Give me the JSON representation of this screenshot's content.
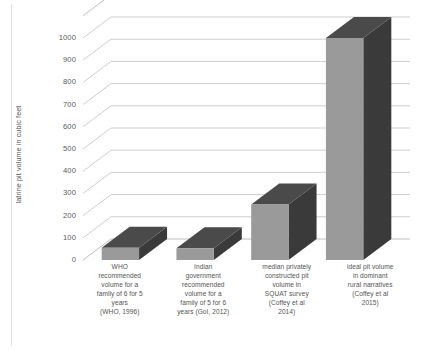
{
  "chart": {
    "ylabel": "latrine pit volume in cubic feet",
    "grid": true,
    "legend": "none"
  },
  "chart_data": {
    "type": "bar",
    "title": "",
    "subtitle": "",
    "xlabel": "",
    "ylabel": "latrine pit volume in cubic feet",
    "ylim": [
      0,
      1000
    ],
    "ytick_labels": [
      "0",
      "100",
      "200",
      "300",
      "400",
      "500",
      "600",
      "700",
      "800",
      "900",
      "1000"
    ],
    "ytick_values": [
      0,
      100,
      200,
      300,
      400,
      500,
      600,
      700,
      800,
      900,
      1000
    ],
    "grid": true,
    "legend_position": "none",
    "style": "3d-bar",
    "categories": [
      "WHO recommended volume for a family of 6 for 5 years (WHO, 1996)",
      "Indian government recommended volume for a family of 5 for 6 years (GoI, 2012)",
      "median privately constructed pit volume in SQUAT survey (Coffey et al 2014)",
      "ideal pit volume in dominant rural narratives (Coffey et al 2015)"
    ],
    "values": [
      55,
      53,
      250,
      1000
    ],
    "colors": {
      "bar_front": "#9a9a9a",
      "bar_top": "#4a4a4a",
      "bar_side": "#3a3a3a",
      "gridline": "#b9b9b9",
      "text": "#555555"
    }
  },
  "category_labels": [
    {
      "lines": [
        "WHO",
        "recommended",
        "volume for a",
        "family of 6 for 5",
        "years",
        "(WHO, 1996)"
      ]
    },
    {
      "lines": [
        "Indian",
        "government",
        "recommended",
        "volume for a",
        "family of 5 for 6",
        "years (GoI, 2012)"
      ]
    },
    {
      "lines": [
        "median privately",
        "constructed pit",
        "volume in",
        "SQUAT survey",
        "(Coffey et al",
        "2014)"
      ]
    },
    {
      "lines": [
        "ideal pit volume",
        "in dominant",
        "rural narratives",
        "(Coffey et al",
        "2015)"
      ]
    }
  ]
}
